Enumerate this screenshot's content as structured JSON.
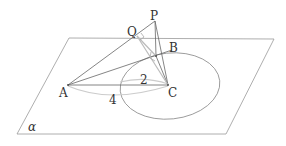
{
  "diagram": {
    "type": "3d-geometry",
    "plane_label": "α",
    "points": {
      "P": {
        "label": "P"
      },
      "Q": {
        "label": "Q"
      },
      "B": {
        "label": "B"
      },
      "A": {
        "label": "A"
      },
      "C": {
        "label": "C"
      }
    },
    "measures": {
      "BC": "2",
      "AC": "4"
    },
    "colors": {
      "line": "#555555",
      "light_line": "#bbbbbb",
      "text": "#333333"
    }
  }
}
